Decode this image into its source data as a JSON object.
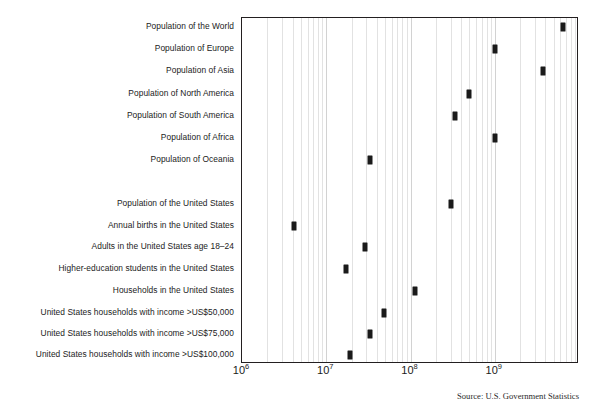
{
  "chart_data": {
    "type": "scatter",
    "title": "",
    "xlabel": "",
    "ylabel": "",
    "xscale": "log",
    "xlim": [
      1000000,
      10000000000
    ],
    "grid": true,
    "legend": null,
    "source": "Source: U.S. Government Statistics",
    "xticks": [
      {
        "value": 1000000,
        "base": "10",
        "exp": "6",
        "label": "10⁶"
      },
      {
        "value": 10000000,
        "base": "10",
        "exp": "7",
        "label": "10⁷"
      },
      {
        "value": 100000000,
        "base": "10",
        "exp": "8",
        "label": "10⁸"
      },
      {
        "value": 1000000000,
        "base": "10",
        "exp": "9",
        "label": "10⁹"
      }
    ],
    "categories": [
      "Population of the World",
      "Population of Europe",
      "Population of Asia",
      "Population of North America",
      "Population of South America",
      "Population of Africa",
      "Population of Oceania",
      "",
      "Population of the United States",
      "Annual births in the United States",
      "Adults in the United States age 18–24",
      "Higher-education students in the United States",
      "Households in the United States",
      "United States households with income >US$50,000",
      "United States households with income >US$75,000",
      "United States households with income >US$100,000"
    ],
    "points": [
      {
        "label": "Population of the World",
        "value": 6500000000,
        "row": 0
      },
      {
        "label": "Population of Europe",
        "value": 1000000000,
        "row": 1
      },
      {
        "label": "Population of Asia",
        "value": 3700000000,
        "row": 2
      },
      {
        "label": "Population of North America",
        "value": 500000000,
        "row": 3
      },
      {
        "label": "Population of South America",
        "value": 340000000,
        "row": 4
      },
      {
        "label": "Population of Africa",
        "value": 1000000000,
        "row": 5
      },
      {
        "label": "Population of Oceania",
        "value": 33000000,
        "row": 6
      },
      {
        "label": "Population of the United States",
        "value": 300000000,
        "row": 8
      },
      {
        "label": "Annual births in the United States",
        "value": 4100000,
        "row": 9
      },
      {
        "label": "Adults in the United States age 18–24",
        "value": 29000000,
        "row": 10
      },
      {
        "label": "Higher-education students in the United States",
        "value": 17000000,
        "row": 11
      },
      {
        "label": "Households in the United States",
        "value": 112000000,
        "row": 12
      },
      {
        "label": "United States households with income >US$50,000",
        "value": 48000000,
        "row": 13
      },
      {
        "label": "United States households with income >US$75,000",
        "value": 33000000,
        "row": 14
      },
      {
        "label": "United States households with income >US$100,000",
        "value": 19000000,
        "row": 15
      }
    ]
  },
  "colors": {
    "marker": "#1a1a1a",
    "frame": "#231f20",
    "gridline": "#e2e2e2",
    "text": "#1b1b1b"
  }
}
